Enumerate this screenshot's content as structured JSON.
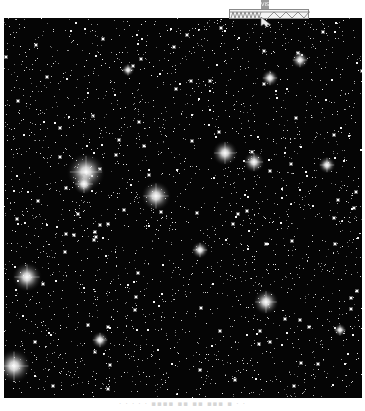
{
  "image": {
    "subject": "dense star field",
    "colors": {
      "background": "#050505",
      "star": "#ffffff",
      "page": "#ffffff"
    },
    "field_bounds": {
      "x": 4,
      "y": 18,
      "width": 358,
      "height": 380
    },
    "bright_stars": [
      {
        "x": 86,
        "y": 172,
        "r": 9
      },
      {
        "x": 84,
        "y": 184,
        "r": 5
      },
      {
        "x": 156,
        "y": 196,
        "r": 7
      },
      {
        "x": 225,
        "y": 153,
        "r": 6
      },
      {
        "x": 254,
        "y": 162,
        "r": 5
      },
      {
        "x": 266,
        "y": 302,
        "r": 6
      },
      {
        "x": 27,
        "y": 277,
        "r": 7
      },
      {
        "x": 14,
        "y": 366,
        "r": 8
      },
      {
        "x": 327,
        "y": 165,
        "r": 4
      },
      {
        "x": 300,
        "y": 60,
        "r": 4
      },
      {
        "x": 270,
        "y": 78,
        "r": 4
      },
      {
        "x": 128,
        "y": 70,
        "r": 3
      },
      {
        "x": 200,
        "y": 250,
        "r": 4
      },
      {
        "x": 100,
        "y": 340,
        "r": 4
      },
      {
        "x": 340,
        "y": 330,
        "r": 3
      }
    ],
    "faint_star_count": 2600
  },
  "overlay": {
    "label": "VIS",
    "icon": "scale-bar-icon"
  },
  "caption": {
    "text": "· · · · ·  ▪▪▪▪ ▪▪ ▪▪   ▪▪▪   ▪  ·  ·"
  }
}
